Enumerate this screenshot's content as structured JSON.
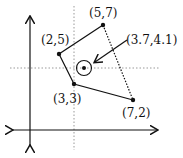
{
  "diagram": {
    "points": [
      {
        "label": "(2, 5)",
        "x": 59,
        "y": 54
      },
      {
        "label": "(5, 7)",
        "x": 103,
        "y": 25
      },
      {
        "label": "(3, 3)",
        "x": 74,
        "y": 84
      },
      {
        "label": "(7, 2)",
        "x": 133,
        "y": 100
      }
    ],
    "centroid": {
      "label": "(3.7, 4.1)"
    },
    "labels": {
      "p1": "(2,5)",
      "p2": "(5,7)",
      "p3": "(3,3)",
      "p4": "(7,2)",
      "centroid": "(3.7,4.1)"
    }
  }
}
